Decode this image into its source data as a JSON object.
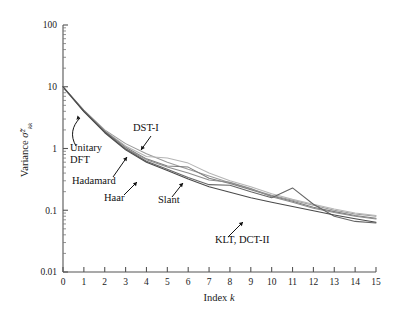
{
  "chart_data": {
    "type": "line",
    "title": "",
    "xlabel": "Index k",
    "ylabel": "Variance σ̃²kk",
    "xlim": [
      0,
      15
    ],
    "ylim": [
      0.01,
      100
    ],
    "yscale": "log",
    "xscale": "linear",
    "grid": false,
    "legend": "inline-annotations",
    "xticks": [
      "0",
      "1",
      "2",
      "3",
      "4",
      "5",
      "6",
      "7",
      "8",
      "9",
      "10",
      "11",
      "12",
      "13",
      "14",
      "15"
    ],
    "yticks": [
      "0.01",
      "0.1",
      "1",
      "10",
      "100"
    ],
    "x": [
      0,
      1,
      2,
      3,
      4,
      5,
      6,
      7,
      8,
      9,
      10,
      11,
      12,
      13,
      14,
      15
    ],
    "series": [
      {
        "name": "Unitary DFT",
        "color": "#9a9a9a",
        "values": [
          10.0,
          4.2,
          2.0,
          1.2,
          0.82,
          0.6,
          0.46,
          0.36,
          0.28,
          0.22,
          0.175,
          0.145,
          0.12,
          0.1,
          0.087,
          0.08
        ]
      },
      {
        "name": "DST-I",
        "color": "#b5b5b5",
        "values": [
          9.7,
          4.0,
          1.95,
          1.1,
          0.74,
          0.7,
          0.58,
          0.4,
          0.3,
          0.24,
          0.185,
          0.15,
          0.125,
          0.105,
          0.09,
          0.082
        ]
      },
      {
        "name": "Hadamard",
        "color": "#7d7d7d",
        "values": [
          10.0,
          4.1,
          1.9,
          1.05,
          0.68,
          0.52,
          0.5,
          0.33,
          0.27,
          0.215,
          0.17,
          0.14,
          0.112,
          0.095,
          0.082,
          0.074
        ]
      },
      {
        "name": "Haar",
        "color": "#8c8c8c",
        "values": [
          9.9,
          4.0,
          1.85,
          1.0,
          0.66,
          0.5,
          0.4,
          0.31,
          0.285,
          0.225,
          0.165,
          0.135,
          0.108,
          0.092,
          0.08,
          0.072
        ]
      },
      {
        "name": "Slant",
        "color": "#666666",
        "values": [
          10.0,
          4.05,
          1.88,
          0.98,
          0.62,
          0.46,
          0.34,
          0.26,
          0.255,
          0.2,
          0.16,
          0.23,
          0.125,
          0.08,
          0.066,
          0.062
        ]
      },
      {
        "name": "KLT, DCT-II",
        "color": "#4a4a4a",
        "values": [
          10.0,
          3.95,
          1.8,
          0.95,
          0.6,
          0.44,
          0.32,
          0.24,
          0.195,
          0.16,
          0.135,
          0.115,
          0.098,
          0.084,
          0.073,
          0.064
        ]
      }
    ],
    "annotations": [
      {
        "label": "Unitary",
        "x": 70,
        "y": 151
      },
      {
        "label": "DFT",
        "x": 70,
        "y": 163
      },
      {
        "label": "DST-I",
        "x": 133,
        "y": 131
      },
      {
        "label": "Hadamard",
        "x": 72,
        "y": 184
      },
      {
        "label": "Haar",
        "x": 104,
        "y": 201
      },
      {
        "label": "Slant",
        "x": 158,
        "y": 203
      },
      {
        "label": "KLT, DCT-II",
        "x": 215,
        "y": 243
      }
    ]
  }
}
